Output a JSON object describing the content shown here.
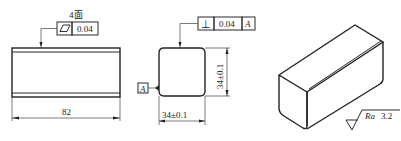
{
  "front_view": {
    "note_label": "4面",
    "tolerance_symbol": "flatness",
    "tolerance_value": "0.04",
    "length_dimension": "82"
  },
  "end_view": {
    "tolerance_symbol": "perpendicularity",
    "tolerance_symbol_glyph": "⊥",
    "tolerance_value": "0.04",
    "datum_ref": "A",
    "datum_label": "A",
    "height_dimension": "34±0.1",
    "width_dimension": "34±0.1"
  },
  "isometric_view": {
    "roughness_label": "Ra",
    "roughness_value": "3.2"
  },
  "colors": {
    "line": "#2a2a2a",
    "background": "#ffffff"
  }
}
